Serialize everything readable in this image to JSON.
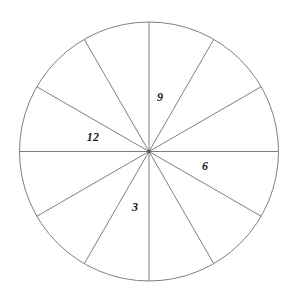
{
  "figure": {
    "title": "",
    "background_color": "#ffffff",
    "width": 293,
    "height": 303
  },
  "chart_data": {
    "type": "pie",
    "title": "",
    "subtitle": "",
    "xlabel": "",
    "ylabel": "",
    "legend_position": "none",
    "grid": false,
    "slice_count": 12,
    "slice_angle_degrees": 30,
    "values": [
      30,
      30,
      30,
      30,
      30,
      30,
      30,
      30,
      30,
      30,
      30,
      30
    ],
    "categories": [
      "1",
      "2",
      "3",
      "4",
      "5",
      "6",
      "7",
      "8",
      "9",
      "10",
      "11",
      "12"
    ],
    "annotations": [
      {
        "text": "9",
        "x": 160,
        "y": 97
      },
      {
        "text": "12",
        "x": 93,
        "y": 137
      },
      {
        "text": "6",
        "x": 205,
        "y": 166
      },
      {
        "text": "3",
        "x": 135,
        "y": 207
      }
    ]
  },
  "geometry": {
    "center_x": 149,
    "center_y": 151.5,
    "radius": 129.5,
    "spoke_count": 12,
    "spoke_angles_degrees": [
      0,
      30,
      60,
      90,
      120,
      150,
      180,
      210,
      240,
      270,
      300,
      330
    ]
  },
  "style": {
    "circle_stroke_color": "#7f7f7f",
    "spoke_stroke_color": "#7f7f7f",
    "label_color": "#1a1a1a",
    "stroke_width": 1
  },
  "labels": {
    "twelve": "12",
    "three": "3",
    "six": "6",
    "nine": "9"
  }
}
